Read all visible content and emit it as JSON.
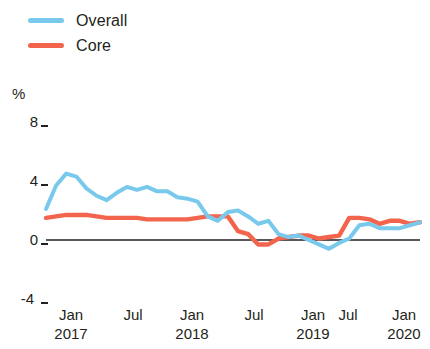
{
  "legend": {
    "position": "top-left",
    "items": [
      {
        "label": "Overall",
        "color": "#79c9ec",
        "name": "legend-item-overall"
      },
      {
        "label": "Core",
        "color": "#f2654c",
        "name": "legend-item-core"
      }
    ]
  },
  "axes": {
    "unit_label": "%",
    "y_ticks": [
      "8",
      "4",
      "0",
      "-4"
    ],
    "x_tick_months": [
      "Jan",
      "Jul",
      "Jan",
      "Jul",
      "Jan",
      "Jul",
      "Jan"
    ],
    "x_tick_years": [
      "2017",
      "",
      "2018",
      "",
      "2019",
      "",
      "2020"
    ]
  },
  "chart_data": {
    "type": "line",
    "title": "",
    "subtitle": "",
    "xlabel": "",
    "ylabel": "%",
    "ylim": [
      -4,
      8
    ],
    "yticks": [
      -4,
      0,
      4,
      8
    ],
    "grid": false,
    "zero_line": true,
    "legend_position": "top-left",
    "x": [
      "2017-01",
      "2017-02",
      "2017-03",
      "2017-04",
      "2017-05",
      "2017-06",
      "2017-07",
      "2017-08",
      "2017-09",
      "2017-10",
      "2017-11",
      "2017-12",
      "2018-01",
      "2018-02",
      "2018-03",
      "2018-04",
      "2018-05",
      "2018-06",
      "2018-07",
      "2018-08",
      "2018-09",
      "2018-10",
      "2018-11",
      "2018-12",
      "2019-01",
      "2019-02",
      "2019-03",
      "2019-04",
      "2019-05",
      "2019-06",
      "2019-07",
      "2019-08",
      "2019-09",
      "2019-10",
      "2019-11",
      "2019-12",
      "2020-01",
      "2020-02"
    ],
    "x_tick_labels": [
      "Jan 2017",
      "Jul",
      "Jan 2018",
      "Jul",
      "Jan 2019",
      "Jul",
      "Jan 2020"
    ],
    "series": [
      {
        "name": "Overall",
        "color": "#79c9ec",
        "values": [
          2.1,
          3.7,
          4.5,
          4.3,
          3.5,
          3.0,
          2.7,
          3.2,
          3.6,
          3.4,
          3.6,
          3.3,
          3.3,
          2.9,
          2.8,
          2.6,
          1.6,
          1.3,
          1.9,
          2.0,
          1.6,
          1.1,
          1.3,
          0.4,
          0.2,
          0.3,
          0.0,
          -0.3,
          -0.6,
          -0.2,
          0.1,
          1.0,
          1.1,
          0.8,
          0.8,
          0.8,
          1.0,
          1.2
        ]
      },
      {
        "name": "Core",
        "color": "#f2654c",
        "values": [
          1.5,
          1.6,
          1.7,
          1.7,
          1.7,
          1.6,
          1.5,
          1.5,
          1.5,
          1.5,
          1.4,
          1.4,
          1.4,
          1.4,
          1.4,
          1.5,
          1.6,
          1.6,
          1.6,
          0.6,
          0.4,
          -0.3,
          -0.3,
          0.1,
          0.2,
          0.3,
          0.3,
          0.1,
          0.2,
          0.3,
          1.5,
          1.5,
          1.4,
          1.1,
          1.3,
          1.3,
          1.1,
          1.2
        ]
      }
    ]
  },
  "colors": {
    "overall": "#79c9ec",
    "core": "#f2654c",
    "axis": "#231f20",
    "background": "#ffffff"
  }
}
